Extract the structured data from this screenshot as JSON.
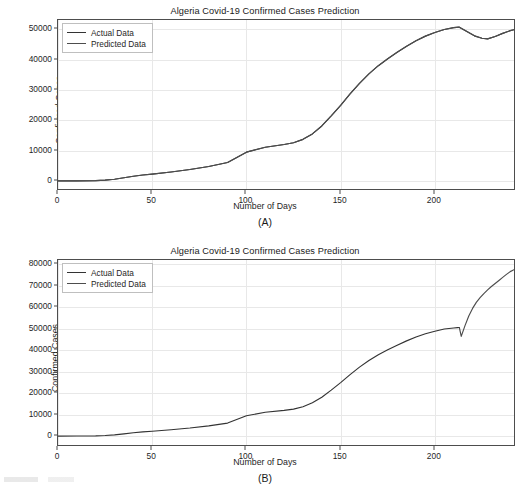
{
  "figure": {
    "panels": [
      {
        "id": "A",
        "caption": "(A)",
        "title": "Algeria Covid-19 Confirmed Cases Prediction",
        "xlabel": "Number of Days",
        "ylabel": "Confirmed Cases",
        "legend": [
          {
            "label": "Actual Data",
            "color": "#333333"
          },
          {
            "label": "Predicted Data",
            "color": "#4d4d4d"
          }
        ]
      },
      {
        "id": "B",
        "caption": "(B)",
        "title": "Algeria Covid-19 Confirmed Cases Prediction",
        "xlabel": "Number of Days",
        "ylabel": "Confirmed Cases",
        "legend": [
          {
            "label": "Actual Data",
            "color": "#333333"
          },
          {
            "label": "Predicted Data",
            "color": "#4d4d4d"
          }
        ]
      }
    ]
  },
  "chart_data": [
    {
      "type": "line",
      "panel": "A",
      "title": "Algeria Covid-19 Confirmed Cases Prediction",
      "xlabel": "Number of Days",
      "ylabel": "Confirmed Cases",
      "xlim": [
        0,
        242
      ],
      "ylim": [
        -2500,
        53000
      ],
      "xticks": [
        0,
        50,
        100,
        150,
        200
      ],
      "yticks": [
        0,
        10000,
        20000,
        30000,
        40000,
        50000
      ],
      "grid": true,
      "legend_position": "upper left",
      "series": [
        {
          "name": "Actual Data",
          "color": "#333333",
          "x": [
            0,
            10,
            20,
            25,
            30,
            35,
            40,
            45,
            50,
            60,
            70,
            80,
            90,
            100,
            110,
            120,
            125,
            130,
            135,
            140,
            145,
            150,
            155,
            160,
            165,
            170,
            175,
            180,
            185,
            190,
            195,
            200,
            205,
            210,
            213,
            217,
            221,
            225,
            228,
            232,
            236,
            240,
            242
          ],
          "y": [
            150,
            180,
            230,
            400,
            700,
            1200,
            1700,
            2100,
            2400,
            3100,
            3900,
            4900,
            6200,
            9600,
            11200,
            12100,
            12700,
            13800,
            15600,
            18200,
            21500,
            25000,
            28700,
            32200,
            35300,
            38000,
            40300,
            42400,
            44400,
            46200,
            47700,
            48900,
            49900,
            50500,
            50650,
            49200,
            47800,
            47000,
            46800,
            47600,
            48600,
            49500,
            49800
          ]
        },
        {
          "name": "Predicted Data",
          "color": "#4d4d4d",
          "x": [
            0,
            10,
            20,
            25,
            30,
            35,
            40,
            45,
            50,
            60,
            70,
            80,
            90,
            100,
            110,
            120,
            125,
            130,
            135,
            140,
            145,
            150,
            155,
            160,
            165,
            170,
            175,
            180,
            185,
            190,
            195,
            200,
            205,
            210,
            213,
            217,
            221,
            225,
            228,
            232,
            236,
            240,
            242
          ],
          "y": [
            150,
            180,
            230,
            400,
            700,
            1200,
            1700,
            2100,
            2400,
            3100,
            3900,
            4900,
            6200,
            9600,
            11200,
            12100,
            12700,
            13800,
            15600,
            18200,
            21500,
            25000,
            28700,
            32200,
            35300,
            38000,
            40300,
            42400,
            44400,
            46200,
            47700,
            48900,
            49900,
            50500,
            50650,
            49200,
            47800,
            47000,
            46800,
            47600,
            48600,
            49500,
            49800
          ]
        }
      ]
    },
    {
      "type": "line",
      "panel": "B",
      "title": "Algeria Covid-19 Confirmed Cases Prediction",
      "xlabel": "Number of Days",
      "ylabel": "Confirmed Cases",
      "xlim": [
        0,
        242
      ],
      "ylim": [
        -4000,
        82000
      ],
      "xticks": [
        0,
        50,
        100,
        150,
        200
      ],
      "yticks": [
        0,
        10000,
        20000,
        30000,
        40000,
        50000,
        60000,
        70000,
        80000
      ],
      "grid": true,
      "legend_position": "upper left",
      "series": [
        {
          "name": "Actual Data",
          "color": "#333333",
          "x": [
            0,
            10,
            20,
            25,
            30,
            35,
            40,
            45,
            50,
            60,
            70,
            80,
            90,
            100,
            110,
            120,
            125,
            130,
            135,
            140,
            145,
            150,
            155,
            160,
            165,
            170,
            175,
            180,
            185,
            190,
            195,
            200,
            205,
            210,
            212,
            213
          ],
          "y": [
            150,
            180,
            230,
            400,
            700,
            1200,
            1700,
            2100,
            2400,
            3100,
            3900,
            4900,
            6200,
            9600,
            11200,
            12100,
            12700,
            13800,
            15600,
            18200,
            21500,
            25000,
            28700,
            32200,
            35300,
            38000,
            40300,
            42400,
            44400,
            46200,
            47700,
            48900,
            49900,
            50400,
            50550,
            50600
          ]
        },
        {
          "name": "Predicted Data",
          "color": "#4d4d4d",
          "x": [
            213,
            214,
            216,
            218,
            220,
            222,
            224,
            226,
            228,
            230,
            232,
            234,
            236,
            238,
            240,
            242
          ],
          "y": [
            50600,
            46500,
            51500,
            56000,
            59500,
            62300,
            64500,
            66400,
            68100,
            69700,
            71100,
            72500,
            73900,
            75300,
            76600,
            77500
          ]
        }
      ]
    }
  ]
}
